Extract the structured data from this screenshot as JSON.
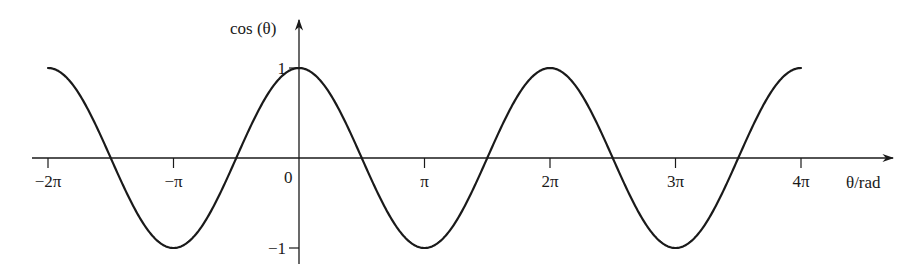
{
  "chart_data": {
    "type": "line",
    "title": "",
    "function": "cos(theta)",
    "xlabel": "θ/rad",
    "ylabel": "cos (θ)",
    "xlim": [
      -6.2832,
      12.5664
    ],
    "ylim": [
      -1,
      1
    ],
    "x_ticks": [
      {
        "value": -6.2832,
        "label": "−2π"
      },
      {
        "value": -3.1416,
        "label": "−π"
      },
      {
        "value": 3.1416,
        "label": "π"
      },
      {
        "value": 6.2832,
        "label": "2π"
      },
      {
        "value": 9.4248,
        "label": "3π"
      },
      {
        "value": 12.5664,
        "label": "4π"
      }
    ],
    "origin_label": "0",
    "y_ticks": [
      {
        "value": 1,
        "label": "1"
      },
      {
        "value": -1,
        "label": "−1"
      }
    ],
    "grid": false,
    "legend": null,
    "series": [
      {
        "name": "cos (θ)",
        "x": [
          -6.2832,
          -4.7124,
          -3.1416,
          -1.5708,
          0,
          1.5708,
          3.1416,
          4.7124,
          6.2832,
          7.854,
          9.4248,
          10.9956,
          12.5664
        ],
        "values": [
          1,
          0,
          -1,
          0,
          1,
          0,
          -1,
          0,
          1,
          0,
          -1,
          0,
          1
        ]
      }
    ],
    "color": "#1a1a1a"
  }
}
